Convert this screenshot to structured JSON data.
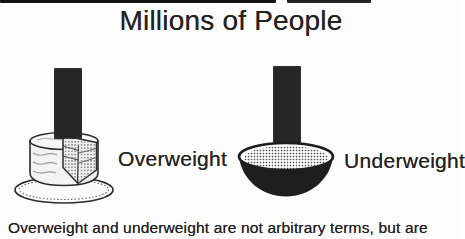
{
  "title": {
    "text": "Millions of People"
  },
  "figure": {
    "left": {
      "icon": "cake-with-slice-icon",
      "label": "Overweight"
    },
    "right": {
      "icon": "bowl-of-food-icon",
      "label": "Underweight"
    }
  },
  "caption": {
    "text": "Overweight and underweight are not arbitrary terms, but are"
  },
  "colors": {
    "background": "#fdfdfd",
    "ink": "#232323",
    "bar": "#262626",
    "artifact": "#121212",
    "outline": "#2b2b2b"
  }
}
